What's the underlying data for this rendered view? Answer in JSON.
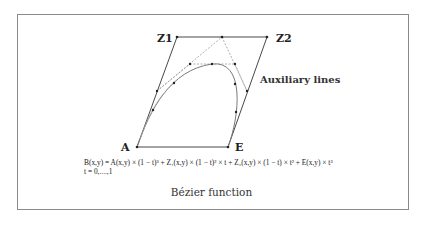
{
  "diagram": {
    "title": "Bézier function",
    "points": {
      "A": {
        "label": "A"
      },
      "E": {
        "label": "E"
      },
      "Z1": {
        "label": "Z1"
      },
      "Z2": {
        "label": "Z2"
      }
    },
    "annotation": "Auxiliary lines",
    "formula": {
      "line1": "B(x,y) = A(x,y) × (1 − t)³ + Z₁(x,y) × (1 − t)² × t + Z₂(x,y) × (1 − t) × t² + E(x,y) × t³",
      "line2": "t = 0,....,1"
    },
    "colors": {
      "frame": "#8a8a8a",
      "control_polygon": "#333333",
      "auxiliary_lines": "#9a9a9a",
      "curve": "#7a7a7a",
      "points": "#222222"
    }
  }
}
